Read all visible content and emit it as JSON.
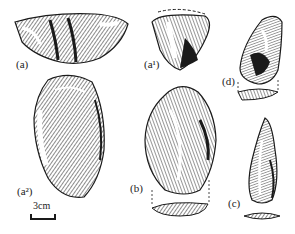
{
  "figure": {
    "labels": {
      "a": "(a)",
      "a1": "(a¹)",
      "a2": "(a²)",
      "b": "(b)",
      "c": "(c)",
      "d": "(d)"
    },
    "scale_bar": {
      "label": "3cm"
    },
    "colors": {
      "ink": "#1a1a1a",
      "background": "#ffffff"
    }
  }
}
